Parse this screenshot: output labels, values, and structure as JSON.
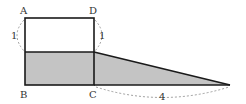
{
  "diagram": {
    "points": {
      "A": {
        "label": "A",
        "x": 25,
        "y": 18
      },
      "D": {
        "label": "D",
        "x": 94,
        "y": 18
      },
      "B": {
        "label": "B",
        "x": 25,
        "y": 85
      },
      "C": {
        "label": "C",
        "x": 94,
        "y": 85
      },
      "E": {
        "x": 25,
        "y": 52
      },
      "F": {
        "x": 94,
        "y": 52
      },
      "G": {
        "x": 230,
        "y": 85
      }
    },
    "measurements": {
      "left_side": "1",
      "right_side": "1",
      "base_extension": "4"
    },
    "colors": {
      "stroke": "#1a1a1a",
      "shade": "#c4c4c4",
      "dashed": "#888888"
    }
  }
}
